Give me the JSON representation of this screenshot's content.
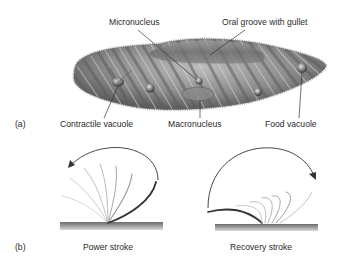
{
  "panel_a": {
    "tag": "(a)",
    "organism": "Paramecium",
    "labels": {
      "micronucleus": "Micronucleus",
      "oral_groove": "Oral groove with gullet",
      "contractile_vacuole": "Contractile vacuole",
      "macronucleus": "Macronucleus",
      "food_vacuole": "Food vacuole"
    }
  },
  "panel_b": {
    "tag": "(b)",
    "labels": {
      "power_stroke": "Power stroke",
      "recovery_stroke": "Recovery stroke"
    }
  },
  "colors": {
    "body_dark": "#5a5a5a",
    "body_mid": "#8c8c8c",
    "body_light": "#c4c4c4",
    "line": "#333333",
    "surface": "#8a8a8a"
  }
}
